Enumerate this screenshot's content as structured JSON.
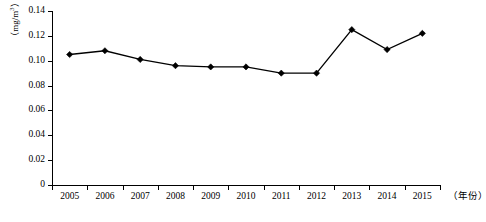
{
  "chart_data": {
    "type": "line",
    "title": "",
    "xlabel": "（年份）",
    "ylabel": "（mg/m3）",
    "ylabel_base": "（mg/m",
    "ylabel_sup": "3",
    "ylabel_tail": "）",
    "categories": [
      "2005",
      "2006",
      "2007",
      "2008",
      "2009",
      "2010",
      "2011",
      "2012",
      "2013",
      "2014",
      "2015"
    ],
    "values": [
      0.105,
      0.108,
      0.101,
      0.096,
      0.095,
      0.095,
      0.09,
      0.09,
      0.125,
      0.109,
      0.122
    ],
    "series": [
      {
        "name": "年均浓度",
        "values": [
          0.105,
          0.108,
          0.101,
          0.096,
          0.095,
          0.095,
          0.09,
          0.09,
          0.125,
          0.109,
          0.122
        ]
      }
    ],
    "ylim": [
      0,
      0.14
    ],
    "yticks": [
      0,
      0.02,
      0.04,
      0.06,
      0.08,
      0.1,
      0.12,
      0.14
    ],
    "ytick_labels": [
      "0",
      "0.02",
      "0.04",
      "0.06",
      "0.08",
      "0.10",
      "0.12",
      "0.14"
    ],
    "grid": false,
    "legend": "none",
    "marker": "diamond",
    "line_color": "#000000",
    "marker_color": "#000000",
    "background_color": "#ffffff"
  }
}
